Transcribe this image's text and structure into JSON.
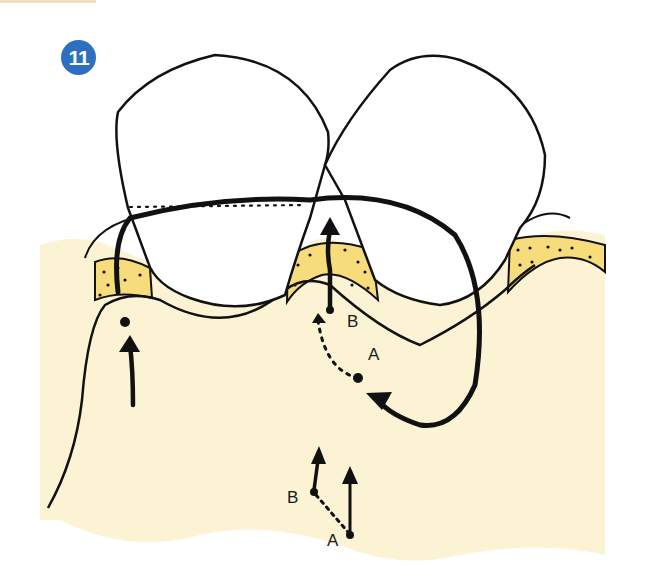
{
  "figure": {
    "number": "11",
    "badge_color": "#2e6fbf"
  },
  "colors": {
    "gingiva": "#fbf3d3",
    "gingiva_edge": "#f7eec6",
    "bone": "#f6dc7a",
    "outline": "#111111",
    "tooth": "#ffffff"
  },
  "labels": {
    "upper_b": "B",
    "upper_a": "A",
    "lower_b": "B",
    "lower_a": "A"
  }
}
